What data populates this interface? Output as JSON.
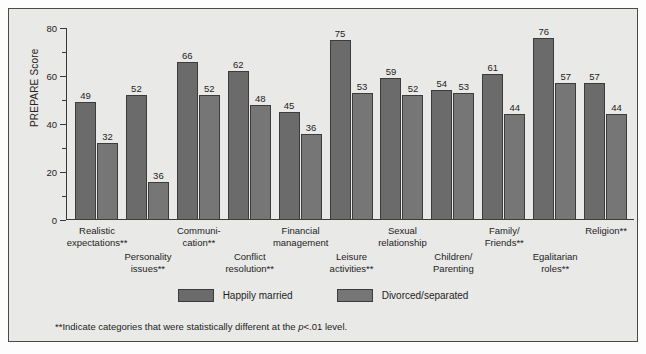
{
  "chart_data": {
    "type": "bar",
    "title": "",
    "xlabel": "",
    "ylabel": "PREPARE Score",
    "ylim": [
      0,
      80
    ],
    "yticks": [
      0,
      20,
      40,
      60,
      80
    ],
    "yticks_minor": [
      10,
      30,
      50,
      70
    ],
    "grid": false,
    "legend_position": "bottom",
    "categories": [
      "Realistic expectations**",
      "Personality issues**",
      "Communi- cation**",
      "Conflict resolution**",
      "Financial management",
      "Leisure activities**",
      "Sexual relationship",
      "Children/ Parenting",
      "Family/ Friends**",
      "Egalitarian roles**",
      "Religion**"
    ],
    "series": [
      {
        "name": "Happily married",
        "color": "#6b6b6b",
        "values": [
          49,
          52,
          66,
          62,
          45,
          75,
          59,
          54,
          61,
          76,
          57
        ]
      },
      {
        "name": "Divorced/separated",
        "color": "#767676",
        "values": [
          32,
          36,
          52,
          48,
          36,
          53,
          52,
          53,
          44,
          57,
          44
        ]
      }
    ],
    "annotations": [
      "**Indicate categories that were statistically different at the p<.01 level."
    ]
  },
  "axis": {
    "y_title": "PREPARE Score",
    "ticks": [
      "0",
      "20",
      "40",
      "60",
      "80"
    ]
  },
  "groups": [
    {
      "label_line1": "Realistic",
      "label_line2": "expectations**",
      "row": 0,
      "v0": "49",
      "v1": "32"
    },
    {
      "label_line1": "Personality",
      "label_line2": "issues**",
      "row": 1,
      "v0": "52",
      "v1": "36"
    },
    {
      "label_line1": "Communi-",
      "label_line2": "cation**",
      "row": 0,
      "v0": "66",
      "v1": "52"
    },
    {
      "label_line1": "Conflict",
      "label_line2": "resolution**",
      "row": 1,
      "v0": "62",
      "v1": "48"
    },
    {
      "label_line1": "Financial",
      "label_line2": "management",
      "row": 0,
      "v0": "45",
      "v1": "36"
    },
    {
      "label_line1": "Leisure",
      "label_line2": "activities**",
      "row": 1,
      "v0": "75",
      "v1": "53"
    },
    {
      "label_line1": "Sexual",
      "label_line2": "relationship",
      "row": 0,
      "v0": "59",
      "v1": "52"
    },
    {
      "label_line1": "Children/",
      "label_line2": "Parenting",
      "row": 1,
      "v0": "54",
      "v1": "53"
    },
    {
      "label_line1": "Family/",
      "label_line2": "Friends**",
      "row": 0,
      "v0": "61",
      "v1": "44"
    },
    {
      "label_line1": "Egalitarian",
      "label_line2": "roles**",
      "row": 1,
      "v0": "76",
      "v1": "57"
    },
    {
      "label_line1": "Religion**",
      "label_line2": "",
      "row": 0,
      "v0": "57",
      "v1": "44"
    }
  ],
  "legend": {
    "items": [
      {
        "label": "Happily married",
        "color": "#6b6b6b"
      },
      {
        "label": "Divorced/separated",
        "color": "#767676"
      }
    ]
  },
  "footnote": {
    "prefix": "**Indicate categories that were statistically different at the ",
    "italic": "p",
    "suffix": "<.01 level."
  }
}
